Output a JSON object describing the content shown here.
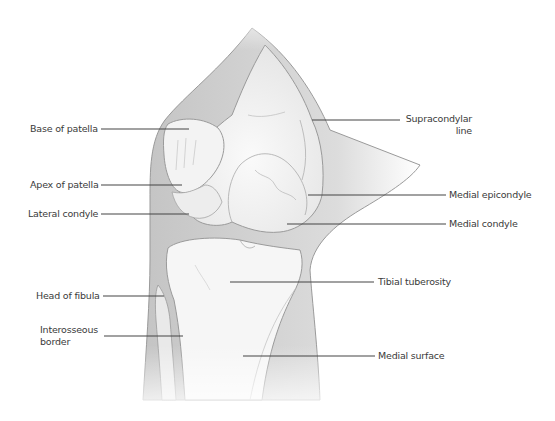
{
  "diagram": {
    "colors": {
      "soft_tissue": "#bdbdbd",
      "bone": "#f4f4f4",
      "outline": "#8a8a8a",
      "leader": "#444444",
      "text": "#3a3a3a"
    },
    "labels_left": [
      {
        "id": "base-of-patella",
        "text": "Base of patella"
      },
      {
        "id": "apex-of-patella",
        "text": "Apex of patella"
      },
      {
        "id": "lateral-condyle",
        "text": "Lateral condyle"
      },
      {
        "id": "head-of-fibula",
        "text": "Head of fibula"
      },
      {
        "id": "interosseous-border",
        "line1": "Interosseous",
        "line2": "border"
      }
    ],
    "labels_right": [
      {
        "id": "supracondylar-line",
        "line1": "Supracondylar",
        "line2": "line"
      },
      {
        "id": "medial-epicondyle",
        "text": "Medial epicondyle"
      },
      {
        "id": "medial-condyle",
        "text": "Medial condyle"
      },
      {
        "id": "tibial-tuberosity",
        "text": "Tibial tuberosity"
      },
      {
        "id": "medial-surface",
        "text": "Medial surface"
      }
    ]
  }
}
